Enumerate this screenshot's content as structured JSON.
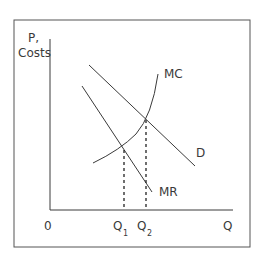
{
  "diagram": {
    "type": "economics-monopoly-diagram",
    "y_axis_label_line1": "P,",
    "y_axis_label_line2": "Costs",
    "x_axis_label": "Q",
    "origin_label": "0",
    "curves": {
      "mc": "MC",
      "d": "D",
      "mr": "MR"
    },
    "q1": {
      "main": "Q",
      "sub": "1"
    },
    "q2": {
      "main": "Q",
      "sub": "2"
    }
  },
  "colors": {
    "line": "#3a3a3a",
    "frame": "#555555",
    "background": "#ffffff"
  }
}
